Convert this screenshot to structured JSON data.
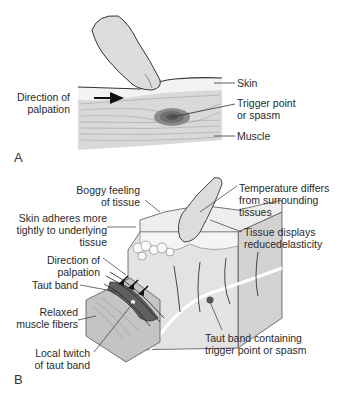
{
  "figure": {
    "panel_a": {
      "letter": "A",
      "labels": {
        "direction": [
          "Direction of",
          "palpation"
        ],
        "skin": "Skin",
        "trigger": [
          "Trigger point",
          "or spasm"
        ],
        "muscle": "Muscle"
      }
    },
    "panel_b": {
      "letter": "B",
      "labels": {
        "boggy": [
          "Boggy feeling",
          "of tissue"
        ],
        "temperature": [
          "Temperature differs",
          "from surrounding",
          "tissues"
        ],
        "skin_adheres": [
          "Skin adheres more",
          "tightly to underlying",
          "tissue"
        ],
        "elasticity": [
          "Tissue displays",
          "reducedelasticity"
        ],
        "direction": [
          "Direction of",
          "palpation"
        ],
        "taut_band": "Taut band",
        "relaxed": [
          "Relaxed",
          "muscle fibers"
        ],
        "local_twitch": [
          "Local twitch",
          "of taut band"
        ],
        "taut_band_containing": [
          "Taut band containing",
          "trigger point or spasm"
        ]
      }
    }
  },
  "colors": {
    "skin": "#f2f2f2",
    "muscle": "#d9d9d9",
    "muscle_lines": "#a8a8a8",
    "knot": "#6e6e6e",
    "finger": "#dcdcdc",
    "outline": "#333333",
    "block_top": "#e8e8e8",
    "block_side": "#d2d2d2",
    "wood": "#c4c4c4"
  }
}
